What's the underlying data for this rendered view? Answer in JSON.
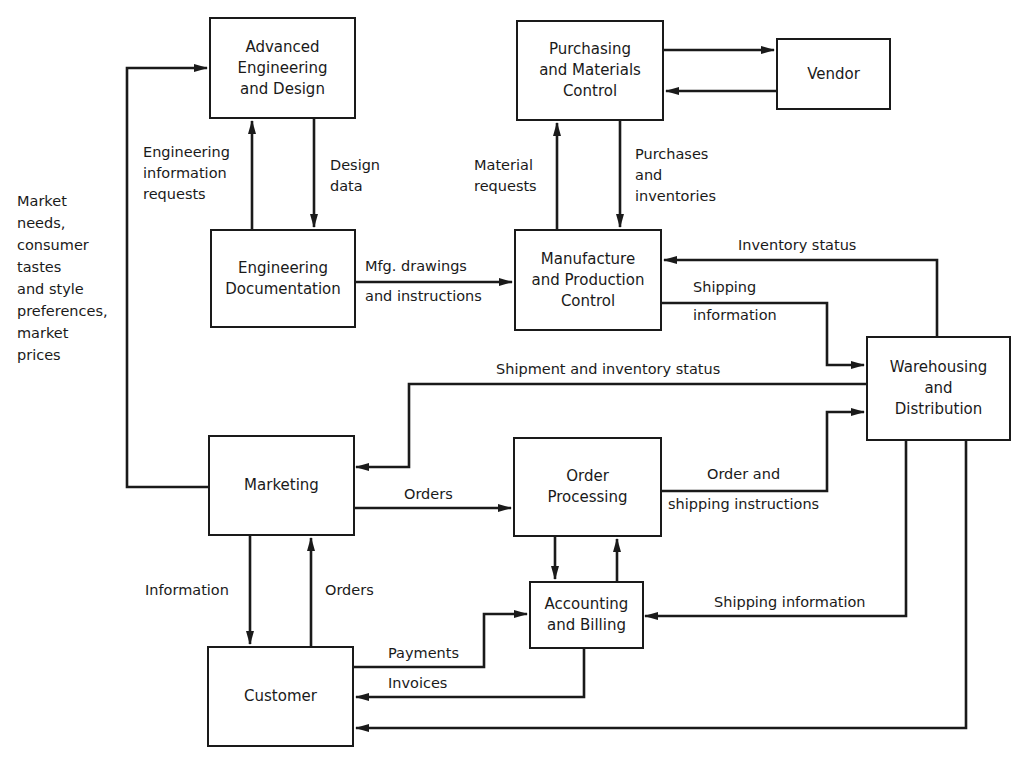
{
  "diagram": {
    "type": "information-flow",
    "nodes": {
      "advanced_engineering": "Advanced\nEngineering\nand Design",
      "purchasing": "Purchasing\nand Materials\nControl",
      "vendor": "Vendor",
      "engineering_documentation": "Engineering\nDocumentation",
      "manufacture": "Manufacture\nand Production\nControl",
      "warehousing": "Warehousing\nand\nDistribution",
      "marketing": "Marketing",
      "order_processing": "Order\nProcessing",
      "accounting": "Accounting\nand Billing",
      "customer": "Customer"
    },
    "edge_labels": {
      "market_needs": "Market\nneeds,\nconsumer\ntastes\nand style\npreferences,\nmarket\nprices",
      "eng_info_requests": "Engineering\ninformation\nrequests",
      "design_data": "Design\ndata",
      "material_requests": "Material\nrequests",
      "purchases_inventories": "Purchases\nand\ninventories",
      "mfg_drawings_1": "Mfg. drawings",
      "mfg_drawings_2": "and instructions",
      "inventory_status": "Inventory status",
      "shipping_info_1": "Shipping",
      "shipping_info_2": "information",
      "shipment_inventory_status": "Shipment and inventory status",
      "orders_marketing": "Orders",
      "order_shipping_1": "Order and",
      "order_shipping_2": "shipping instructions",
      "information": "Information",
      "orders_customer": "Orders",
      "shipping_information": "Shipping information",
      "payments": "Payments",
      "invoices": "Invoices"
    },
    "edges": [
      {
        "from": "marketing",
        "to": "advanced_engineering",
        "label": "Market needs, consumer tastes and style preferences, market prices"
      },
      {
        "from": "engineering_documentation",
        "to": "advanced_engineering",
        "label": "Engineering information requests"
      },
      {
        "from": "advanced_engineering",
        "to": "engineering_documentation",
        "label": "Design data"
      },
      {
        "from": "purchasing",
        "to": "vendor",
        "label": ""
      },
      {
        "from": "vendor",
        "to": "purchasing",
        "label": ""
      },
      {
        "from": "manufacture",
        "to": "purchasing",
        "label": "Material requests"
      },
      {
        "from": "purchasing",
        "to": "manufacture",
        "label": "Purchases and inventories"
      },
      {
        "from": "engineering_documentation",
        "to": "manufacture",
        "label": "Mfg. drawings and instructions"
      },
      {
        "from": "warehousing",
        "to": "manufacture",
        "label": "Inventory status"
      },
      {
        "from": "manufacture",
        "to": "warehousing",
        "label": "Shipping information"
      },
      {
        "from": "warehousing",
        "to": "marketing",
        "label": "Shipment and inventory status"
      },
      {
        "from": "marketing",
        "to": "order_processing",
        "label": "Orders"
      },
      {
        "from": "order_processing",
        "to": "warehousing",
        "label": "Order and shipping instructions"
      },
      {
        "from": "order_processing",
        "to": "accounting",
        "label": ""
      },
      {
        "from": "accounting",
        "to": "order_processing",
        "label": ""
      },
      {
        "from": "warehousing",
        "to": "accounting",
        "label": "Shipping information"
      },
      {
        "from": "marketing",
        "to": "customer",
        "label": "Information"
      },
      {
        "from": "customer",
        "to": "marketing",
        "label": "Orders"
      },
      {
        "from": "customer",
        "to": "accounting",
        "label": "Payments"
      },
      {
        "from": "accounting",
        "to": "customer",
        "label": "Invoices"
      },
      {
        "from": "warehousing",
        "to": "customer",
        "label": ""
      }
    ]
  }
}
